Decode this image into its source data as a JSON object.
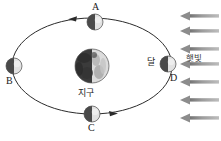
{
  "figure": {
    "background_color": "#ffffff",
    "width": 221,
    "height": 141
  },
  "center_body": {
    "name": "earth",
    "label": "지구",
    "label_meaning": "Earth",
    "cx": 92,
    "cy": 66,
    "r": 17,
    "dark_color": "#3c3c3c",
    "light_color": "#d9d9d9",
    "lit_side": "right"
  },
  "orbit": {
    "name": "moon-orbit",
    "cx": 92,
    "cy": 66,
    "rx": 80,
    "ry": 48,
    "stroke": "#2b2b2b",
    "stroke_width": 1,
    "direction": "counterclockwise",
    "direction_markers": [
      {
        "name": "orbit-arrow-top",
        "x": 72,
        "y": 19,
        "points": "left"
      },
      {
        "name": "orbit-arrow-bottom",
        "x": 112,
        "y": 114,
        "points": "right"
      }
    ]
  },
  "moons": [
    {
      "id": "A",
      "label": "A",
      "cx": 95,
      "cy": 22,
      "r": 8,
      "label_x": 92,
      "label_y": 2,
      "position": "top",
      "dark_color": "#4a4a4a",
      "light_color": "#e2e2e2",
      "lit_side": "right"
    },
    {
      "id": "B",
      "label": "B",
      "cx": 14,
      "cy": 66,
      "r": 8,
      "label_x": 8,
      "label_y": 78,
      "position": "left",
      "dark_color": "#4a4a4a",
      "light_color": "#e2e2e2",
      "lit_side": "right"
    },
    {
      "id": "C",
      "label": "C",
      "cx": 92,
      "cy": 114,
      "r": 8,
      "label_x": 89,
      "label_y": 124,
      "position": "bottom",
      "dark_color": "#4a4a4a",
      "light_color": "#e2e2e2",
      "lit_side": "right"
    },
    {
      "id": "D",
      "label": "D",
      "cx": 168,
      "cy": 64,
      "r": 8,
      "label_x": 170,
      "label_y": 75,
      "position": "right",
      "dark_color": "#4a4a4a",
      "light_color": "#e2e2e2",
      "lit_side": "right"
    }
  ],
  "moon_name_label": {
    "name": "moon-label",
    "label": "달",
    "label_meaning": "Moon",
    "x": 148,
    "y": 58
  },
  "sunlight": {
    "name": "sunlight-rays",
    "label": "햇빛",
    "label_meaning": "Sunlight",
    "label_x": 186,
    "label_y": 55,
    "direction": "leftward",
    "arrow_color": "#8c8c8c",
    "arrow_count": 7,
    "arrows": [
      {
        "y": 16,
        "x_start": 219,
        "x_end": 182
      },
      {
        "y": 31,
        "x_start": 219,
        "x_end": 182
      },
      {
        "y": 49,
        "x_start": 219,
        "x_end": 182
      },
      {
        "y": 64,
        "x_start": 219,
        "x_end": 182
      },
      {
        "y": 82,
        "x_start": 219,
        "x_end": 182
      },
      {
        "y": 100,
        "x_start": 219,
        "x_end": 182
      },
      {
        "y": 118,
        "x_start": 219,
        "x_end": 182
      }
    ]
  }
}
